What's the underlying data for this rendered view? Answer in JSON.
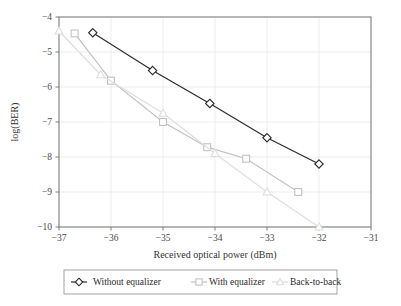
{
  "chart_data": {
    "type": "line",
    "title": "",
    "xlabel": "Received optical power (dBm)",
    "ylabel": "log(BER)",
    "xlim": [
      -37,
      -31
    ],
    "ylim": [
      -10,
      -4
    ],
    "xticks": [
      -37,
      -36,
      -35,
      -34,
      -33,
      -32,
      -31
    ],
    "xtick_labels": [
      "−37",
      "−36",
      "−35",
      "−34",
      "−33",
      "−32",
      "−31"
    ],
    "yticks": [
      -4,
      -5,
      -6,
      -7,
      -8,
      -9,
      -10
    ],
    "ytick_labels": [
      "−4",
      "−5",
      "−6",
      "−7",
      "−8",
      "−9",
      "−10"
    ],
    "grid": true,
    "legend_position": "below-outside",
    "series": [
      {
        "name": "Without equalizer",
        "marker": "diamond",
        "color": "#2b2b2b",
        "x": [
          -36.35,
          -35.2,
          -34.1,
          -33.0,
          -32.0
        ],
        "y": [
          -4.45,
          -5.53,
          -6.47,
          -7.45,
          -8.2
        ]
      },
      {
        "name": "With equalizer",
        "marker": "square",
        "color": "#c2c2c2",
        "x": [
          -36.7,
          -36.0,
          -35.0,
          -34.15,
          -33.4,
          -32.4
        ],
        "y": [
          -4.47,
          -5.82,
          -7.0,
          -7.72,
          -8.05,
          -9.0
        ]
      },
      {
        "name": "Back-to-back",
        "marker": "triangle",
        "color": "#dedede",
        "x": [
          -37.0,
          -36.2,
          -35.0,
          -34.0,
          -33.0,
          -32.0
        ],
        "y": [
          -4.4,
          -5.65,
          -6.75,
          -7.9,
          -9.0,
          -10.0
        ]
      }
    ]
  },
  "legend": {
    "items": [
      {
        "label": "Without equalizer"
      },
      {
        "label": "With equalizer"
      },
      {
        "label": "Back-to-back"
      }
    ]
  },
  "axes": {
    "x_title": "Received optical power (dBm)",
    "y_title": "log(BER)"
  }
}
